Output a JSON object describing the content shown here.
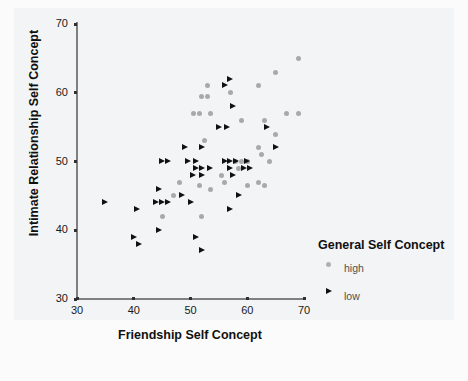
{
  "chart_data": {
    "type": "scatter",
    "title": "",
    "xlabel": "Friendship Self Concept",
    "ylabel": "Intimate Relationship Self Concept",
    "xlim": [
      30,
      70
    ],
    "ylim": [
      30,
      70
    ],
    "xticks": [
      30,
      40,
      50,
      60,
      70
    ],
    "yticks": [
      30,
      40,
      50,
      60,
      70
    ],
    "grid": false,
    "legend": {
      "title": "General Self Concept",
      "position": "right-bottom",
      "entries": [
        {
          "name": "high",
          "marker": "circle",
          "color": "#a9a9a9"
        },
        {
          "name": "low",
          "marker": "triangle-right",
          "color": "#111111"
        }
      ]
    },
    "series": [
      {
        "name": "high",
        "marker": "circle",
        "color": "#a9a9a9",
        "points": [
          [
            69,
            65
          ],
          [
            65,
            63
          ],
          [
            62,
            61
          ],
          [
            53,
            61
          ],
          [
            57,
            60
          ],
          [
            52,
            59.5
          ],
          [
            53,
            59.5
          ],
          [
            50.5,
            57
          ],
          [
            51.5,
            57
          ],
          [
            53.5,
            57
          ],
          [
            67,
            57
          ],
          [
            69,
            57
          ],
          [
            59,
            56
          ],
          [
            63,
            56
          ],
          [
            65,
            54
          ],
          [
            52.5,
            53
          ],
          [
            62,
            52
          ],
          [
            62.5,
            51
          ],
          [
            58,
            50
          ],
          [
            59,
            50
          ],
          [
            60,
            50
          ],
          [
            64,
            50
          ],
          [
            58.5,
            49
          ],
          [
            55.5,
            48
          ],
          [
            62,
            47
          ],
          [
            48,
            47
          ],
          [
            56,
            47
          ],
          [
            51.5,
            46.5
          ],
          [
            60,
            46.5
          ],
          [
            63,
            46.5
          ],
          [
            53.5,
            46
          ],
          [
            47,
            45
          ],
          [
            45,
            42
          ],
          [
            52,
            42
          ]
        ]
      },
      {
        "name": "low",
        "marker": "triangle-right",
        "color": "#111111",
        "points": [
          [
            57,
            62
          ],
          [
            56,
            61
          ],
          [
            57.5,
            58
          ],
          [
            55,
            55
          ],
          [
            56.5,
            55
          ],
          [
            63.5,
            55
          ],
          [
            49,
            52
          ],
          [
            52,
            52
          ],
          [
            45,
            50
          ],
          [
            46,
            50
          ],
          [
            49.5,
            50
          ],
          [
            51,
            50
          ],
          [
            56,
            50
          ],
          [
            57,
            50
          ],
          [
            58,
            50
          ],
          [
            60,
            50
          ],
          [
            51,
            49
          ],
          [
            52,
            49
          ],
          [
            53.5,
            49
          ],
          [
            57,
            49
          ],
          [
            59.5,
            49
          ],
          [
            60.5,
            49
          ],
          [
            50.5,
            48
          ],
          [
            52,
            48
          ],
          [
            57.5,
            48
          ],
          [
            65,
            52
          ],
          [
            44.5,
            46
          ],
          [
            48.5,
            45
          ],
          [
            44,
            44
          ],
          [
            45,
            44
          ],
          [
            46,
            44
          ],
          [
            35,
            44
          ],
          [
            50,
            44
          ],
          [
            40.5,
            43
          ],
          [
            44.5,
            40
          ],
          [
            40,
            39
          ],
          [
            51,
            39
          ],
          [
            41,
            38
          ],
          [
            52,
            37
          ],
          [
            58.5,
            45
          ],
          [
            57,
            43
          ]
        ]
      }
    ]
  }
}
